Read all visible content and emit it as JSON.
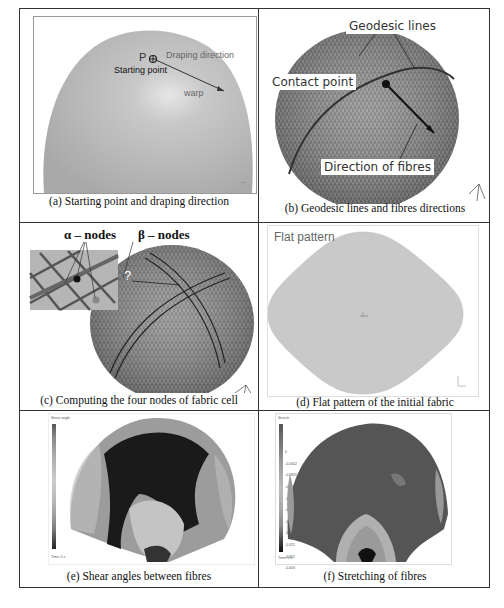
{
  "figure": {
    "panels": [
      {
        "id": "a",
        "caption": "(a) Starting point and draping direction",
        "labels": {
          "point": "P",
          "starting_point": "Starting point",
          "draping_direction": "Draping direction",
          "warp": "warp"
        }
      },
      {
        "id": "b",
        "caption": "(b) Geodesic lines and fibres directions",
        "labels": {
          "geodesic_lines": "Geodesic lines",
          "contact_point": "Contact point",
          "direction_of_fibres": "Direction of fibres"
        }
      },
      {
        "id": "c",
        "caption": "(c) Computing the four nodes of fabric cell",
        "labels": {
          "alpha_nodes": "α – nodes",
          "beta_nodes": "β – nodes",
          "question": "?"
        }
      },
      {
        "id": "d",
        "caption": "(d) Flat pattern of the initial fabric",
        "labels": {
          "flat_pattern": "Flat pattern"
        }
      },
      {
        "id": "e",
        "caption": "(e) Shear angles between fibres",
        "legend": {
          "title": "Shear angle",
          "footer": "Time: 0 s"
        }
      },
      {
        "id": "f",
        "caption": "(f) Stretching of fibres",
        "legend": {
          "title": "Stretch",
          "ticks": [
            "0",
            "-0.0402",
            "-0.0805",
            "-0.121",
            "-0.161",
            "-0.201",
            "-0.241",
            "-0.282",
            "-0.322",
            "-0.362",
            "-0.403"
          ],
          "footer": "Time: 0 s"
        }
      }
    ]
  }
}
